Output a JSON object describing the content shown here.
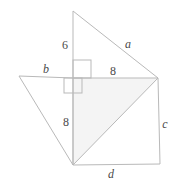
{
  "figure": {
    "canvas": {
      "width": 175,
      "height": 185
    },
    "stroke_color": "#b9b9b9",
    "shaded_fill": "#f4f4f4",
    "label_color": "#4a4a4a",
    "background": "#ffffff",
    "points": {
      "apex_top": {
        "x": 73,
        "y": 11
      },
      "center": {
        "x": 73,
        "y": 78
      },
      "right": {
        "x": 158,
        "y": 78
      },
      "left": {
        "x": 19,
        "y": 76
      },
      "bottom_left": {
        "x": 73,
        "y": 165
      },
      "bottom_right": {
        "x": 160,
        "y": 164
      }
    },
    "shapes": [
      {
        "name": "top-right-triangle",
        "vertices": "73,11 73,78 158,78",
        "filled": false
      },
      {
        "name": "left-triangle",
        "vertices": "19,76 73,78 73,165",
        "filled": false
      },
      {
        "name": "shaded-center-triangle",
        "vertices": "73,78 158,78 73,165",
        "filled": true
      },
      {
        "name": "bottom-right-triangle",
        "vertices": "73,165 158,78 160,164",
        "filled": false
      }
    ],
    "right_angle_marks": [
      {
        "name": "right-angle-upper",
        "x": 73,
        "y": 60,
        "w": 18,
        "h": 18
      },
      {
        "name": "right-angle-lower",
        "x": 64,
        "y": 78,
        "w": 18,
        "h": 15
      }
    ],
    "labels": [
      {
        "id": "side-6",
        "text": "6",
        "kind": "num",
        "x": 65,
        "y": 45
      },
      {
        "id": "side-a",
        "text": "a",
        "kind": "var",
        "x": 128,
        "y": 44
      },
      {
        "id": "side-b",
        "text": "b",
        "kind": "var",
        "x": 46,
        "y": 69
      },
      {
        "id": "side-8-top",
        "text": "8",
        "kind": "num",
        "x": 113,
        "y": 71
      },
      {
        "id": "side-8-left",
        "text": "8",
        "kind": "num",
        "x": 66,
        "y": 122
      },
      {
        "id": "side-c",
        "text": "c",
        "kind": "var",
        "x": 165,
        "y": 124
      },
      {
        "id": "side-d",
        "text": "d",
        "kind": "var",
        "x": 111,
        "y": 174
      }
    ]
  }
}
